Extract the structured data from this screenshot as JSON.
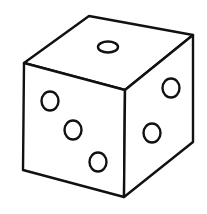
{
  "image": {
    "subject": "six-sided die line drawing",
    "description": "Outline drawing of a cube-shaped die in perspective showing three faces",
    "colors": {
      "background": "#ffffff",
      "stroke": "#111111"
    }
  },
  "die": {
    "faces": [
      {
        "name": "top",
        "pips": 1
      },
      {
        "name": "left-front",
        "pips": 3
      },
      {
        "name": "right-front",
        "pips": 2
      }
    ]
  }
}
